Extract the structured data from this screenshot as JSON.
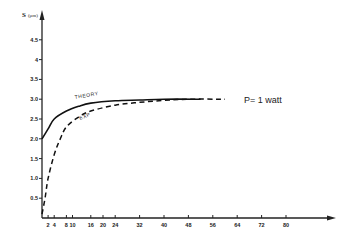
{
  "chart_data": {
    "type": "line",
    "title": "",
    "xlabel": "",
    "ylabel": "S (μm)",
    "xlim": [
      0,
      90
    ],
    "ylim": [
      0,
      5
    ],
    "grid": false,
    "x_ticks": [
      2,
      4,
      8,
      10,
      16,
      20,
      24,
      32,
      40,
      48,
      56,
      64,
      72,
      80
    ],
    "y_ticks": [
      0.5,
      1.0,
      1.5,
      2.0,
      2.5,
      3.0,
      3.5,
      4,
      4.5
    ],
    "y_tick_labels": [
      "0.5",
      "1.0",
      "1.5",
      "2.0",
      "2.5",
      "3.0",
      "3.5",
      "4",
      "4.5"
    ],
    "series": [
      {
        "name": "THEORY",
        "style": "solid",
        "x": [
          0,
          2,
          4,
          8,
          12,
          16,
          24,
          32,
          40,
          52
        ],
        "y": [
          2.0,
          2.25,
          2.5,
          2.7,
          2.82,
          2.9,
          2.96,
          2.98,
          3.0,
          3.0
        ]
      },
      {
        "name": "EXP",
        "style": "dashed",
        "x": [
          0,
          1,
          2,
          4,
          6,
          8,
          12,
          16,
          24,
          32,
          40,
          48,
          60
        ],
        "y": [
          0.1,
          0.5,
          1.0,
          1.6,
          2.0,
          2.3,
          2.55,
          2.7,
          2.85,
          2.92,
          2.97,
          3.0,
          3.0
        ]
      }
    ],
    "annotations": [
      "P= 1 watt"
    ],
    "legend": "inline curve labels"
  },
  "labels": {
    "y_axis": "S",
    "y_unit": "(μm)",
    "theory": "THEORY",
    "exp": "EXP",
    "power": "P= 1 watt"
  }
}
